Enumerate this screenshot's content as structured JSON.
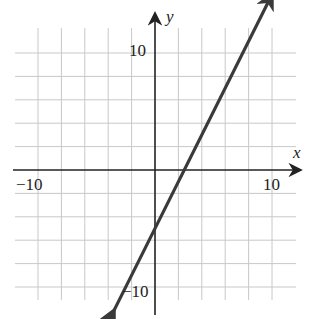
{
  "chart_data": {
    "type": "line",
    "title": "",
    "xlabel": "x",
    "ylabel": "y",
    "xlim": [
      -12,
      12
    ],
    "ylim": [
      -12,
      12
    ],
    "grid": true,
    "grid_step": 2,
    "tick_labels": {
      "x": [
        "-10",
        "10"
      ],
      "y": [
        "10",
        "-10"
      ]
    },
    "series": [
      {
        "name": "line",
        "equation": "y = 2x - 5",
        "slope": 2,
        "y_intercept": -5,
        "x_intercept": 2.5,
        "x": [
          -3.5,
          10
        ],
        "y": [
          -12,
          15
        ],
        "arrows": "both",
        "color": "#3a3a3a"
      }
    ]
  },
  "labels": {
    "x_axis": "x",
    "y_axis": "y",
    "x_neg": "−10",
    "x_pos": "10",
    "y_pos": "10",
    "y_neg": "−10"
  },
  "colors": {
    "grid": "#c8c8c8",
    "axis": "#222222",
    "line": "#3a3a3a",
    "background": "#ffffff"
  }
}
